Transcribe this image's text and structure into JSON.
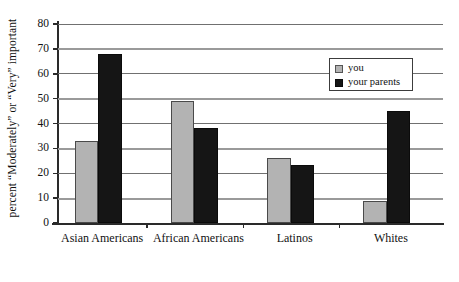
{
  "chart_data": {
    "type": "bar",
    "title": "",
    "xlabel": "",
    "ylabel": "percent “Moderately” or “Very” important",
    "categories": [
      "Asian Americans",
      "African Americans",
      "Latinos",
      "Whites"
    ],
    "series": [
      {
        "name": "you",
        "color": "#b3b3b3",
        "values": [
          33,
          49,
          26,
          9
        ]
      },
      {
        "name": "your parents",
        "color": "#151515",
        "values": [
          68,
          38,
          23.5,
          45
        ]
      }
    ],
    "ylim": [
      0,
      80
    ],
    "ytick_labels": [
      "0",
      "10",
      "20",
      "30",
      "40",
      "50",
      "60",
      "70",
      "80"
    ],
    "ytick_values": [
      0,
      10,
      20,
      30,
      40,
      50,
      60,
      70,
      80
    ],
    "grid": "horizontal",
    "legend_position": "top-right"
  },
  "legend": {
    "entries": [
      {
        "label": "you",
        "swatch": "legend-swatch-you"
      },
      {
        "label": "your parents",
        "swatch": "legend-swatch-parents"
      }
    ]
  },
  "colors": {
    "you": "#b3b3b3",
    "your_parents": "#151515",
    "axis": "#2a2a2a",
    "gridline": "#707070",
    "background": "#ffffff"
  }
}
